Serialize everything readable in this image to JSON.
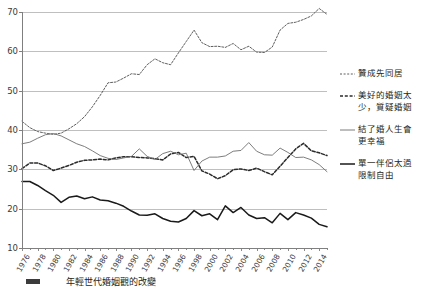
{
  "chart_data": {
    "type": "line",
    "title": "",
    "xlabel": "",
    "ylabel": "",
    "ylim": [
      10,
      70
    ],
    "yticks": [
      10,
      20,
      30,
      40,
      50,
      60,
      70
    ],
    "grid": true,
    "legend_position": "right",
    "x": [
      1976,
      1977,
      1978,
      1979,
      1980,
      1981,
      1982,
      1983,
      1984,
      1985,
      1986,
      1987,
      1988,
      1989,
      1990,
      1991,
      1992,
      1993,
      1994,
      1995,
      1996,
      1997,
      1998,
      1999,
      2000,
      2001,
      2002,
      2003,
      2004,
      2005,
      2006,
      2007,
      2008,
      2009,
      2010,
      2011,
      2012,
      2013,
      2014,
      2015
    ],
    "xticks": [
      "1976",
      "1978",
      "1980",
      "1982",
      "1984",
      "1986",
      "1988",
      "1990",
      "1992",
      "1994",
      "1996",
      "1998",
      "2000",
      "2002",
      "2004",
      "2006",
      "2008",
      "2010",
      "2012",
      "2014"
    ],
    "series": [
      {
        "name": "贊成先同居",
        "style": "dashed-fine",
        "color": "#4d4d4d",
        "values": [
          42.2,
          40.6,
          39.6,
          39.2,
          38.9,
          39.2,
          40.3,
          41.6,
          43.4,
          45.9,
          48.8,
          52.0,
          52.2,
          53.2,
          54.3,
          54.1,
          56.6,
          58.1,
          57.1,
          56.6,
          59.6,
          62.5,
          65.4,
          62.2,
          61.2,
          61.3,
          61.0,
          62.0,
          60.4,
          61.3,
          59.8,
          59.7,
          61.1,
          65.4,
          67.1,
          67.4,
          68.1,
          69.0,
          70.9,
          69.4
        ]
      },
      {
        "name": "美好的婚姻太少，質疑婚姻",
        "style": "dashed-bold",
        "color": "#2b2b2b",
        "values": [
          30.2,
          31.6,
          31.6,
          30.9,
          29.7,
          30.3,
          31.0,
          31.8,
          32.3,
          32.4,
          32.6,
          32.4,
          32.9,
          33.2,
          33.2,
          33.0,
          32.9,
          32.7,
          32.4,
          33.9,
          34.3,
          33.0,
          33.3,
          29.6,
          28.8,
          27.6,
          28.4,
          29.9,
          30.1,
          29.7,
          30.3,
          29.4,
          28.6,
          30.8,
          33.0,
          35.2,
          36.6,
          34.7,
          34.2,
          33.5
        ]
      },
      {
        "name": "結了婚人生會更幸福",
        "style": "solid-fine",
        "color": "#6e6e6e",
        "values": [
          36.5,
          36.9,
          37.9,
          38.8,
          39.1,
          38.5,
          37.5,
          36.5,
          35.8,
          34.7,
          33.5,
          32.8,
          32.5,
          32.9,
          33.3,
          35.2,
          33.3,
          32.5,
          34.0,
          34.6,
          33.7,
          34.1,
          29.7,
          32.1,
          33.1,
          33.1,
          33.4,
          34.6,
          34.8,
          36.8,
          34.6,
          33.7,
          33.6,
          35.4,
          34.3,
          33.0,
          33.1,
          32.4,
          31.2,
          29.4
        ]
      },
      {
        "name": "單一伴侶太過限制自由",
        "style": "solid-bold",
        "color": "#1a1a1a",
        "values": [
          26.9,
          26.9,
          25.9,
          24.6,
          23.4,
          21.6,
          22.9,
          23.2,
          22.5,
          23.0,
          22.2,
          22.0,
          21.4,
          20.6,
          19.4,
          18.4,
          18.3,
          18.7,
          17.5,
          16.8,
          16.6,
          17.5,
          19.5,
          18.2,
          18.7,
          17.2,
          20.7,
          19.0,
          20.3,
          18.4,
          17.5,
          17.7,
          16.4,
          18.8,
          17.2,
          19.0,
          18.4,
          17.6,
          16.0,
          15.4
        ]
      }
    ]
  },
  "legend": {
    "items": [
      {
        "label": "贊成先同居",
        "style": "dashed-fine"
      },
      {
        "label": "美好的婚姻太\n少，質疑婚姻",
        "style": "dashed-bold"
      },
      {
        "label": "結了婚人生會\n更幸福",
        "style": "solid-fine"
      },
      {
        "label": "單一伴侶太過\n限制自由",
        "style": "solid-bold"
      }
    ]
  },
  "caption": {
    "text": "年輕世代婚姻觀的改變"
  }
}
